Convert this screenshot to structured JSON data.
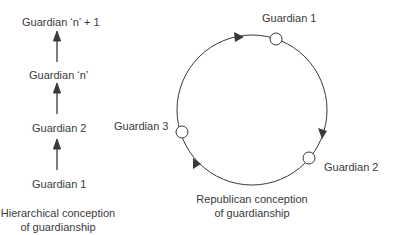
{
  "hierarchical": {
    "nodes": [
      {
        "label": "Guardian ‘n’ + 1"
      },
      {
        "label": "Guardian ‘n’"
      },
      {
        "label": "Guardian 2"
      },
      {
        "label": "Guardian 1"
      }
    ],
    "caption_line1": "Hierarchical conception",
    "caption_line2": "of guardianship"
  },
  "republican": {
    "nodes": [
      {
        "label": "Guardian 1"
      },
      {
        "label": "Guardian 2"
      },
      {
        "label": "Guardian 3"
      }
    ],
    "caption_line1": "Republican conception",
    "caption_line2": "of guardianship"
  },
  "colors": {
    "line": "#3a3a3a",
    "text": "#3a3a3a",
    "background": "#ffffff"
  }
}
